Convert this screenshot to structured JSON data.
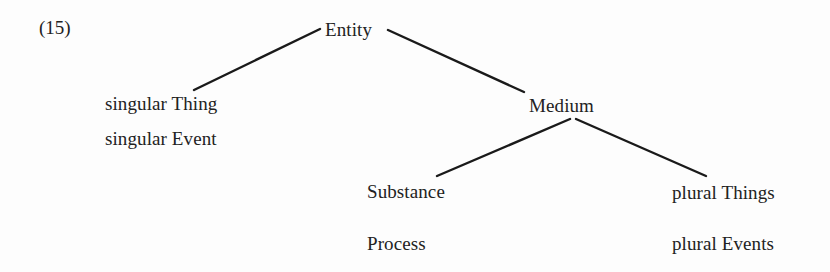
{
  "figure": {
    "example_number": "(15)",
    "background_color": "#fdfdfd",
    "text_color": "#222222",
    "line_color": "#1a1a1a"
  },
  "nodes": [
    {
      "id": "entity",
      "label": "Entity"
    },
    {
      "id": "medium",
      "label": "Medium"
    },
    {
      "id": "singular_thing",
      "label": "singular Thing"
    },
    {
      "id": "singular_event",
      "label": "singular Event"
    },
    {
      "id": "substance",
      "label": "Substance"
    },
    {
      "id": "process",
      "label": "Process"
    },
    {
      "id": "plural_things",
      "label": "plural Things"
    },
    {
      "id": "plural_events",
      "label": "plural Events"
    }
  ],
  "edges": [
    {
      "from": "entity",
      "to": "singular_thing",
      "x1": 320,
      "y1": 29,
      "x2": 194,
      "y2": 90
    },
    {
      "from": "entity",
      "to": "medium",
      "x1": 388,
      "y1": 30,
      "x2": 524,
      "y2": 92
    },
    {
      "from": "medium",
      "to": "substance",
      "x1": 570,
      "y1": 119,
      "x2": 437,
      "y2": 176
    },
    {
      "from": "medium",
      "to": "plural_things",
      "x1": 576,
      "y1": 119,
      "x2": 706,
      "y2": 176
    }
  ]
}
